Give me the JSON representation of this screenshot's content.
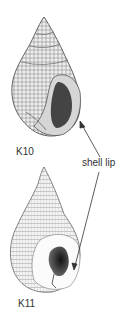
{
  "figure": {
    "top_label_fragment": "K9",
    "specimens": [
      {
        "id": "K10",
        "label": "K10"
      },
      {
        "id": "K11",
        "label": "K11"
      }
    ],
    "annotation": {
      "label": "shell lip"
    },
    "colors": {
      "ink": "#333333",
      "shell_light": "#e8e8e8",
      "shell_mid": "#9a9a9a",
      "aperture_dark": "#222222"
    }
  }
}
